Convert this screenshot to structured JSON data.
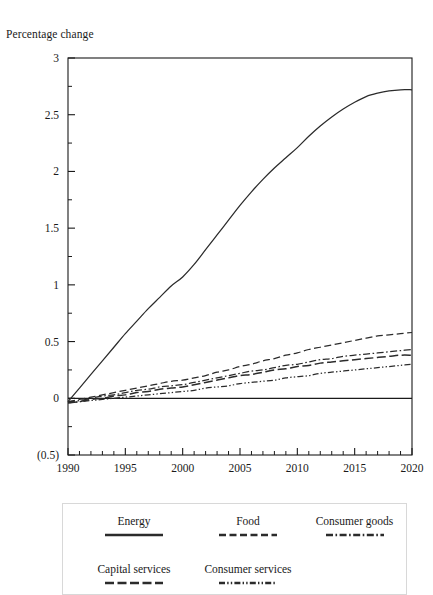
{
  "chart_data": {
    "type": "line",
    "title": "",
    "ylabel": "Percentage change",
    "xlabel": "",
    "ylim": [
      -0.5,
      3
    ],
    "xlim": [
      1990,
      2020
    ],
    "grid": false,
    "legend_position": "bottom",
    "y_ticks": [
      "3",
      "2.5",
      "2",
      "1.5",
      "1",
      "0.5",
      "0",
      "(0.5)"
    ],
    "y_tick_values": [
      3,
      2.5,
      2,
      1.5,
      1,
      0.5,
      0,
      -0.5
    ],
    "y_minor_step": 0.25,
    "x_ticks": [
      "1990",
      "1995",
      "2000",
      "2005",
      "2010",
      "2015",
      "2020"
    ],
    "x_tick_values": [
      1990,
      1995,
      2000,
      2005,
      2010,
      2015,
      2020
    ],
    "x_minor_step": 1,
    "x": [
      1990,
      1991,
      1992,
      1993,
      1994,
      1995,
      1996,
      1997,
      1998,
      1999,
      2000,
      2001,
      2002,
      2003,
      2004,
      2005,
      2006,
      2007,
      2008,
      2009,
      2010,
      2011,
      2012,
      2013,
      2014,
      2015,
      2016,
      2017,
      2018,
      2019,
      2020
    ],
    "series": [
      {
        "name": "Energy",
        "style": "solid",
        "values": [
          -0.03,
          0.09,
          0.21,
          0.33,
          0.45,
          0.57,
          0.68,
          0.79,
          0.89,
          0.99,
          1.07,
          1.18,
          1.31,
          1.44,
          1.57,
          1.7,
          1.82,
          1.93,
          2.03,
          2.12,
          2.21,
          2.31,
          2.4,
          2.48,
          2.55,
          2.61,
          2.66,
          2.69,
          2.71,
          2.72,
          2.72
        ]
      },
      {
        "name": "Food",
        "style": "dashed",
        "values": [
          -0.03,
          -0.01,
          0.01,
          0.03,
          0.05,
          0.07,
          0.09,
          0.11,
          0.13,
          0.15,
          0.16,
          0.18,
          0.2,
          0.23,
          0.25,
          0.28,
          0.3,
          0.33,
          0.35,
          0.38,
          0.4,
          0.43,
          0.45,
          0.47,
          0.49,
          0.51,
          0.53,
          0.55,
          0.56,
          0.57,
          0.58
        ]
      },
      {
        "name": "Consumer goods",
        "style": "dashdot",
        "values": [
          -0.03,
          -0.02,
          0.0,
          0.02,
          0.03,
          0.05,
          0.07,
          0.08,
          0.1,
          0.11,
          0.12,
          0.14,
          0.16,
          0.18,
          0.2,
          0.22,
          0.24,
          0.25,
          0.27,
          0.29,
          0.3,
          0.32,
          0.34,
          0.35,
          0.37,
          0.38,
          0.39,
          0.4,
          0.41,
          0.42,
          0.43
        ]
      },
      {
        "name": "Capital services",
        "style": "longdash",
        "values": [
          -0.04,
          -0.03,
          -0.01,
          0.0,
          0.02,
          0.03,
          0.05,
          0.06,
          0.08,
          0.09,
          0.1,
          0.12,
          0.14,
          0.16,
          0.18,
          0.2,
          0.21,
          0.23,
          0.25,
          0.26,
          0.28,
          0.29,
          0.31,
          0.32,
          0.33,
          0.34,
          0.35,
          0.36,
          0.37,
          0.38,
          0.38
        ]
      },
      {
        "name": "Consumer services",
        "style": "dashdotdot",
        "values": [
          -0.04,
          -0.03,
          -0.02,
          -0.01,
          0.0,
          0.01,
          0.02,
          0.03,
          0.04,
          0.05,
          0.06,
          0.07,
          0.09,
          0.1,
          0.11,
          0.13,
          0.14,
          0.15,
          0.16,
          0.18,
          0.19,
          0.2,
          0.22,
          0.23,
          0.24,
          0.25,
          0.26,
          0.27,
          0.28,
          0.29,
          0.3
        ]
      }
    ]
  },
  "legend": {
    "rows": [
      [
        {
          "label": "Energy",
          "style": "solid"
        },
        {
          "label": "Food",
          "style": "dashed"
        },
        {
          "label": "Consumer goods",
          "style": "dashdot"
        }
      ],
      [
        {
          "label": "Capital services",
          "style": "longdash"
        },
        {
          "label": "Consumer services",
          "style": "dashdotdot"
        }
      ]
    ]
  },
  "colors": {
    "line": "#2b2b2b",
    "axis": "#1a1a1a",
    "text": "#1a1a1a",
    "background": "#ffffff"
  }
}
